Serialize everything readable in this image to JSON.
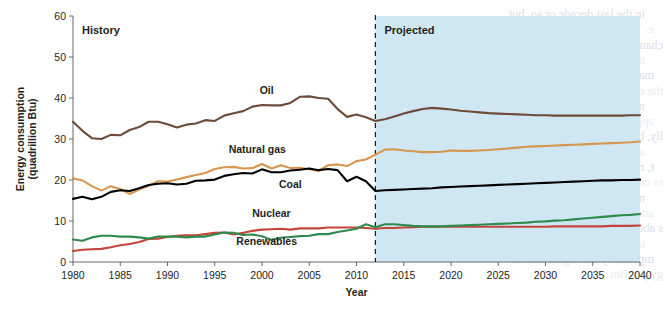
{
  "chart_data": {
    "type": "line",
    "title": "",
    "xlabel": "Year",
    "ylabel": "Energy consumption\n(quadrillion Btu)",
    "ylabel_line1": "Energy consumption",
    "ylabel_line2": "(quadrillion Btu)",
    "xlim": [
      1980,
      2040
    ],
    "ylim": [
      0,
      60
    ],
    "ytick_values": [
      0,
      10,
      20,
      30,
      40,
      50,
      60
    ],
    "ytick_labels": [
      "0",
      "10",
      "20",
      "30",
      "40",
      "50",
      "60"
    ],
    "xtick_values": [
      1980,
      1985,
      1990,
      1995,
      2000,
      2005,
      2010,
      2015,
      2020,
      2025,
      2030,
      2035,
      2040
    ],
    "xtick_labels": [
      "1980",
      "1985",
      "1990",
      "1995",
      "2000",
      "2005",
      "2010",
      "2015",
      "2020",
      "2025",
      "2030",
      "2035",
      "2040"
    ],
    "grid": false,
    "legend_position": "inline-labels",
    "divider_year": 2012,
    "regions": [
      {
        "name": "History",
        "label": "History",
        "x_start": 1980,
        "x_end": 2012,
        "fill": "#ffffff"
      },
      {
        "name": "Projected",
        "label": "Projected",
        "x_start": 2012,
        "x_end": 2040,
        "fill": "#cfe7f2"
      }
    ],
    "series": [
      {
        "name": "Oil",
        "label": "Oil",
        "color": "#6e4a38",
        "label_x": 2000.5,
        "label_y": 41.0,
        "x": [
          1980,
          1981,
          1982,
          1983,
          1984,
          1985,
          1986,
          1987,
          1988,
          1989,
          1990,
          1991,
          1992,
          1993,
          1994,
          1995,
          1996,
          1997,
          1998,
          1999,
          2000,
          2001,
          2002,
          2003,
          2004,
          2005,
          2006,
          2007,
          2008,
          2009,
          2010,
          2011,
          2012,
          2013,
          2014,
          2015,
          2016,
          2017,
          2018,
          2019,
          2020,
          2021,
          2022,
          2023,
          2024,
          2025,
          2026,
          2027,
          2028,
          2029,
          2030,
          2031,
          2032,
          2033,
          2034,
          2035,
          2036,
          2037,
          2038,
          2039,
          2040
        ],
        "values": [
          34.2,
          32.0,
          30.2,
          30.0,
          31.0,
          30.9,
          32.2,
          32.9,
          34.2,
          34.2,
          33.6,
          32.8,
          33.5,
          33.8,
          34.6,
          34.4,
          35.7,
          36.3,
          36.8,
          37.9,
          38.3,
          38.2,
          38.2,
          38.8,
          40.3,
          40.4,
          40.0,
          39.8,
          37.3,
          35.4,
          36.0,
          35.3,
          34.4,
          34.8,
          35.5,
          36.2,
          36.8,
          37.3,
          37.6,
          37.4,
          37.2,
          36.9,
          36.7,
          36.5,
          36.3,
          36.2,
          36.1,
          36.0,
          35.9,
          35.8,
          35.8,
          35.7,
          35.7,
          35.7,
          35.7,
          35.7,
          35.7,
          35.7,
          35.7,
          35.8,
          35.8
        ]
      },
      {
        "name": "Natural gas",
        "label": "Natural gas",
        "color": "#d89550",
        "label_x": 1999.5,
        "label_y": 26.5,
        "x": [
          1980,
          1981,
          1982,
          1983,
          1984,
          1985,
          1986,
          1987,
          1988,
          1989,
          1990,
          1991,
          1992,
          1993,
          1994,
          1995,
          1996,
          1997,
          1998,
          1999,
          2000,
          2001,
          2002,
          2003,
          2004,
          2005,
          2006,
          2007,
          2008,
          2009,
          2010,
          2011,
          2012,
          2013,
          2014,
          2015,
          2016,
          2017,
          2018,
          2019,
          2020,
          2021,
          2022,
          2023,
          2024,
          2025,
          2026,
          2027,
          2028,
          2029,
          2030,
          2031,
          2032,
          2033,
          2034,
          2035,
          2036,
          2037,
          2038,
          2039,
          2040
        ],
        "values": [
          20.4,
          19.9,
          18.5,
          17.4,
          18.5,
          17.8,
          16.6,
          17.7,
          18.6,
          19.7,
          19.6,
          20.1,
          20.7,
          21.2,
          21.7,
          22.7,
          23.1,
          23.2,
          22.8,
          22.9,
          23.9,
          22.8,
          23.6,
          22.9,
          23.0,
          22.6,
          22.2,
          23.6,
          23.8,
          23.4,
          24.6,
          25.0,
          26.2,
          27.4,
          27.5,
          27.2,
          27.0,
          26.8,
          26.8,
          26.9,
          27.2,
          27.1,
          27.1,
          27.2,
          27.3,
          27.5,
          27.7,
          27.9,
          28.1,
          28.2,
          28.3,
          28.4,
          28.5,
          28.6,
          28.7,
          28.8,
          28.9,
          29.0,
          29.1,
          29.2,
          29.4
        ]
      },
      {
        "name": "Coal",
        "label": "Coal",
        "color": "#000000",
        "label_x": 2003.0,
        "label_y": 18.0,
        "x": [
          1980,
          1981,
          1982,
          1983,
          1984,
          1985,
          1986,
          1987,
          1988,
          1989,
          1990,
          1991,
          1992,
          1993,
          1994,
          1995,
          1996,
          1997,
          1998,
          1999,
          2000,
          2001,
          2002,
          2003,
          2004,
          2005,
          2006,
          2007,
          2008,
          2009,
          2010,
          2011,
          2012,
          2013,
          2014,
          2015,
          2016,
          2017,
          2018,
          2019,
          2020,
          2021,
          2022,
          2023,
          2024,
          2025,
          2026,
          2027,
          2028,
          2029,
          2030,
          2031,
          2032,
          2033,
          2034,
          2035,
          2036,
          2037,
          2038,
          2039,
          2040
        ],
        "values": [
          15.4,
          15.9,
          15.3,
          15.9,
          17.1,
          17.5,
          17.3,
          18.0,
          18.8,
          19.1,
          19.2,
          18.9,
          19.1,
          19.8,
          19.9,
          20.1,
          21.0,
          21.4,
          21.7,
          21.6,
          22.6,
          21.9,
          21.9,
          22.3,
          22.5,
          22.8,
          22.4,
          22.7,
          22.4,
          19.7,
          20.8,
          19.7,
          17.3,
          17.5,
          17.6,
          17.7,
          17.8,
          17.9,
          18.0,
          18.2,
          18.3,
          18.4,
          18.5,
          18.6,
          18.7,
          18.8,
          18.9,
          19.0,
          19.1,
          19.2,
          19.3,
          19.4,
          19.5,
          19.6,
          19.7,
          19.8,
          19.9,
          19.9,
          20.0,
          20.0,
          20.1
        ]
      },
      {
        "name": "Nuclear",
        "label": "Nuclear",
        "color": "#c3453b",
        "label_x": 2001.0,
        "label_y": 11.0,
        "x": [
          1980,
          1981,
          1982,
          1983,
          1984,
          1985,
          1986,
          1987,
          1988,
          1989,
          1990,
          1991,
          1992,
          1993,
          1994,
          1995,
          1996,
          1997,
          1998,
          1999,
          2000,
          2001,
          2002,
          2003,
          2004,
          2005,
          2006,
          2007,
          2008,
          2009,
          2010,
          2011,
          2012,
          2013,
          2014,
          2015,
          2016,
          2017,
          2018,
          2019,
          2020,
          2021,
          2022,
          2023,
          2024,
          2025,
          2026,
          2027,
          2028,
          2029,
          2030,
          2031,
          2032,
          2033,
          2034,
          2035,
          2036,
          2037,
          2038,
          2039,
          2040
        ],
        "values": [
          2.7,
          3.0,
          3.1,
          3.2,
          3.6,
          4.1,
          4.4,
          4.9,
          5.6,
          5.7,
          6.1,
          6.4,
          6.5,
          6.5,
          6.8,
          7.1,
          7.2,
          6.7,
          7.1,
          7.6,
          7.9,
          8.0,
          8.1,
          7.9,
          8.2,
          8.2,
          8.2,
          8.4,
          8.4,
          8.4,
          8.4,
          8.3,
          8.1,
          8.3,
          8.3,
          8.4,
          8.5,
          8.6,
          8.6,
          8.6,
          8.6,
          8.6,
          8.6,
          8.6,
          8.6,
          8.6,
          8.6,
          8.6,
          8.6,
          8.6,
          8.6,
          8.7,
          8.7,
          8.7,
          8.7,
          8.7,
          8.7,
          8.8,
          8.8,
          8.8,
          8.9
        ]
      },
      {
        "name": "Renewables",
        "label": "Renewables",
        "color": "#2f8a4e",
        "label_x": 2000.5,
        "label_y": 4.2,
        "x": [
          1980,
          1981,
          1982,
          1983,
          1984,
          1985,
          1986,
          1987,
          1988,
          1989,
          1990,
          1991,
          1992,
          1993,
          1994,
          1995,
          1996,
          1997,
          1998,
          1999,
          2000,
          2001,
          2002,
          2003,
          2004,
          2005,
          2006,
          2007,
          2008,
          2009,
          2010,
          2011,
          2012,
          2013,
          2014,
          2015,
          2016,
          2017,
          2018,
          2019,
          2020,
          2021,
          2022,
          2023,
          2024,
          2025,
          2026,
          2027,
          2028,
          2029,
          2030,
          2031,
          2032,
          2033,
          2034,
          2035,
          2036,
          2037,
          2038,
          2039,
          2040
        ],
        "values": [
          5.5,
          5.2,
          6.0,
          6.4,
          6.4,
          6.2,
          6.2,
          6.0,
          5.7,
          6.2,
          6.2,
          6.2,
          6.0,
          6.2,
          6.2,
          6.7,
          7.2,
          7.1,
          6.6,
          6.7,
          6.3,
          5.4,
          5.9,
          6.1,
          6.3,
          6.4,
          6.8,
          6.8,
          7.3,
          7.7,
          8.1,
          9.2,
          8.5,
          9.2,
          9.2,
          9.0,
          8.8,
          8.7,
          8.7,
          8.7,
          8.8,
          8.9,
          9.0,
          9.1,
          9.2,
          9.3,
          9.4,
          9.5,
          9.6,
          9.8,
          9.9,
          10.1,
          10.2,
          10.4,
          10.6,
          10.8,
          11.0,
          11.2,
          11.4,
          11.5,
          11.7
        ]
      }
    ]
  },
  "annotations": {
    "history_label": "History",
    "projected_label": "Projected"
  },
  "colors": {
    "projected_background": "#cfe7f2",
    "axis": "#58585a",
    "text": "#231f20",
    "oil": "#6e4a38",
    "natural_gas": "#d89550",
    "coal": "#000000",
    "nuclear": "#c3453b",
    "renewables": "#2f8a4e"
  },
  "ghost_text": {
    "lines": [
      "in the last decade or so, but",
      "e. This effect is the by-product of",
      "changes in the use of building materials,",
      "the increase in demand for office",
      "machines, coupled with more insulation in",
      "the exterior building",
      "n. Finally, the increasing use of",
      "appliances increases the heating",
      "lly, but it also increases the cooling",
      "ant, if one were to sum up the year-",
      "t, more efficient buildings have",
      "ss energy use than conventional",
      "n, it must also be noted that the",
      "and the heat from the",
      "s about 5% of the total heating",
      "ter efficiency of electric",
      "mpered by the higher cost of",
      "gy per Btu"
    ]
  }
}
